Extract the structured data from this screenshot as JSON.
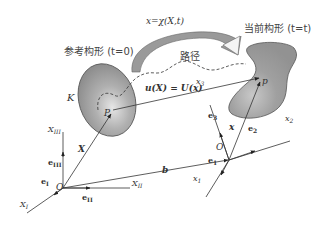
{
  "diagram": {
    "type": "continuum-mechanics-configuration",
    "labels": {
      "mapping": "x=χ(X,t)",
      "reference_config": "参考构形 (t=0)",
      "current_config": "当前构形 (t=t)",
      "path": "路径",
      "displacement": "u(X) = U(x)",
      "body_symbol": "K",
      "point_ref": "P",
      "point_cur": "p",
      "vec_X": "X",
      "vec_x": "x",
      "vec_b": "b",
      "origin_ref": "O",
      "origin_cur": "O",
      "axis_XI": "X",
      "axis_XI_sub": "I",
      "axis_XII": "X",
      "axis_XII_sub": "II",
      "axis_XIII": "X",
      "axis_XIII_sub": "III",
      "basis_eI": "e",
      "basis_eI_sub": "I",
      "basis_eII": "e",
      "basis_eII_sub": "II",
      "basis_eIII": "e",
      "basis_eIII_sub": "III",
      "axis_x1": "x",
      "axis_x1_sub": "1",
      "axis_x2": "x",
      "axis_x2_sub": "2",
      "axis_x3": "x",
      "axis_x3_sub": "3",
      "basis_e1": "e",
      "basis_e1_sub": "1",
      "basis_e2": "e",
      "basis_e2_sub": "2",
      "basis_e3": "e",
      "basis_e3_sub": "3"
    },
    "colors": {
      "body_fill": "#9a9a9a",
      "body_stroke": "#555555",
      "line": "#333333",
      "arrow_fill": "#8f8f8f"
    }
  }
}
